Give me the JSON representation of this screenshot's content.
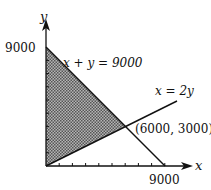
{
  "diagram": {
    "type": "feasible-region",
    "axes": {
      "x_label": "x",
      "y_label": "y",
      "x_tick_label": "9000",
      "y_tick_label": "9000",
      "range": [
        0,
        9000
      ],
      "tick_step": 1000
    },
    "lines": [
      {
        "name": "x-plus-y",
        "equation": "x + y = 9000",
        "from": [
          0,
          9000
        ],
        "to": [
          9000,
          0
        ]
      },
      {
        "name": "x-eq-2y",
        "equation": "x = 2y",
        "from": [
          0,
          0
        ],
        "to": [
          10000,
          5000
        ]
      }
    ],
    "region": {
      "vertices": [
        [
          0,
          0
        ],
        [
          0,
          9000
        ],
        [
          6000,
          3000
        ]
      ],
      "fill": "cross-hatched gray"
    },
    "intersection": {
      "label": "(6000, 3000)",
      "point": [
        6000,
        3000
      ]
    },
    "colors": {
      "line": "#111111",
      "region": "#8a8a8a",
      "background": "#ffffff"
    }
  }
}
